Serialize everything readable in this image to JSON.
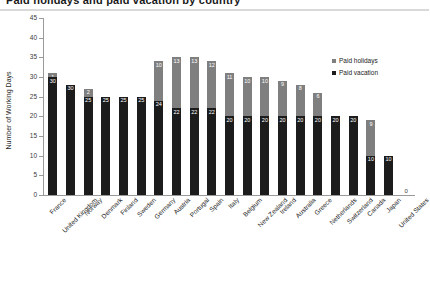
{
  "chart_data": {
    "type": "bar",
    "subtype": "stacked-bar",
    "title": "Paid holidays and paid vacation by country",
    "xlabel": "",
    "ylabel": "Number of Working Days",
    "ylim": [
      0,
      45
    ],
    "yticks": [
      0,
      5,
      10,
      15,
      20,
      25,
      30,
      35,
      40,
      45
    ],
    "grid": false,
    "legend_position": "inside-top-right",
    "categories": [
      "France",
      "United Kingdom",
      "Norway",
      "Denmark",
      "Finland",
      "Sweden",
      "Germany",
      "Austria",
      "Portugal",
      "Spain",
      "Italy",
      "Belgium",
      "New Zealand",
      "Ireland",
      "Australia",
      "Greece",
      "Netherlands",
      "Switzerland",
      "Canada",
      "Japan",
      "United States"
    ],
    "series": [
      {
        "name": "Paid vacation",
        "color": "#1c1c1c",
        "values": [
          30,
          28,
          25,
          25,
          25,
          25,
          24,
          22,
          22,
          22,
          20,
          20,
          20,
          20,
          20,
          20,
          20,
          20,
          10,
          10,
          0
        ],
        "labels": [
          "30",
          "30",
          "25",
          "25",
          "25",
          "25",
          "24",
          "22",
          "22",
          "22",
          "20",
          "20",
          "20",
          "20",
          "20",
          "20",
          "20",
          "20",
          "10",
          "10",
          ""
        ]
      },
      {
        "name": "Paid holidays",
        "color": "#7f7f7f",
        "values": [
          1,
          0,
          2,
          0,
          0,
          0,
          10,
          13,
          13,
          12,
          11,
          10,
          10,
          9,
          8,
          6,
          0,
          0,
          9,
          0,
          0
        ],
        "labels": [
          "1",
          "",
          "2",
          "",
          "",
          "",
          "10",
          "13",
          "13",
          "12",
          "11",
          "10",
          "10",
          "9",
          "8",
          "6",
          "",
          "",
          "9",
          "",
          ""
        ]
      }
    ],
    "totals": [
      31,
      28,
      27,
      25,
      25,
      25,
      34,
      35,
      35,
      34,
      31,
      30,
      30,
      29,
      28,
      26,
      20,
      20,
      19,
      10,
      0
    ],
    "zero_label": "0",
    "annotations": []
  },
  "legend": {
    "items": [
      {
        "label": "Paid holidays",
        "color": "#7f7f7f"
      },
      {
        "label": "Paid vacation",
        "color": "#1c1c1c"
      }
    ]
  }
}
